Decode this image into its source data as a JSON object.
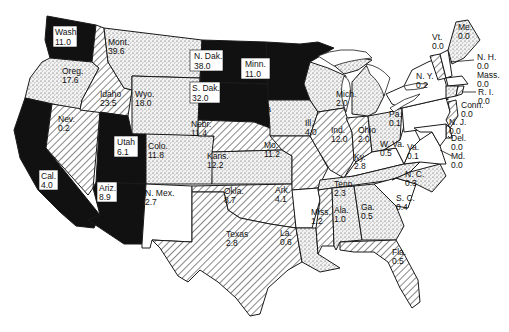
{
  "map": {
    "type": "choropleth",
    "region": "United States (48 contiguous states)",
    "fill_classes": {
      "black": "solid black",
      "dotted": "stippled",
      "hatched": "diagonal hatching",
      "white": "blank"
    },
    "colors": {
      "ink": "#1a1a1a",
      "paper": "#ffffff"
    }
  },
  "states": {
    "wash": {
      "name": "Wash.",
      "value": "11.0",
      "fill": "black"
    },
    "oreg": {
      "name": "Oreg.",
      "value": "17.6",
      "fill": "dotted"
    },
    "cal": {
      "name": "Cal.",
      "value": "4.0",
      "fill": "black"
    },
    "idaho": {
      "name": "Idaho",
      "value": "23.5",
      "fill": "hatched"
    },
    "nev": {
      "name": "Nev.",
      "value": "0.2",
      "fill": "hatched"
    },
    "mont": {
      "name": "Mont.",
      "value": "39.6",
      "fill": "dotted"
    },
    "wyo": {
      "name": "Wyo.",
      "value": "18.0",
      "fill": "dotted"
    },
    "utah": {
      "name": "Utah",
      "value": "6.1",
      "fill": "black"
    },
    "ariz": {
      "name": "Ariz.",
      "value": "8.9",
      "fill": "black"
    },
    "colo": {
      "name": "Colo.",
      "value": "11.8",
      "fill": "dotted"
    },
    "nmex": {
      "name": "N. Mex.",
      "value": "2.7",
      "fill": "white"
    },
    "ndak": {
      "name": "N. Dak.",
      "value": "38.0",
      "fill": "black"
    },
    "sdak": {
      "name": "S. Dak.",
      "value": "32.0",
      "fill": "black"
    },
    "nebr": {
      "name": "Nebr.",
      "value": "11.4",
      "fill": "hatched"
    },
    "kans": {
      "name": "Kans.",
      "value": "12.2",
      "fill": "dotted"
    },
    "okla": {
      "name": "Okla.",
      "value": "8.7",
      "fill": "hatched"
    },
    "texas": {
      "name": "Texas",
      "value": "2.8",
      "fill": "hatched"
    },
    "minn": {
      "name": "Minn.",
      "value": "11.0",
      "fill": "black"
    },
    "iowa": {
      "name": "Iowa",
      "value": "19.9",
      "fill": "dotted"
    },
    "mo": {
      "name": "Mo.",
      "value": "11.2",
      "fill": "hatched"
    },
    "ark": {
      "name": "Ark.",
      "value": "4.1",
      "fill": "white"
    },
    "la": {
      "name": "La.",
      "value": "0.6",
      "fill": "dotted"
    },
    "wis": {
      "name": "Wis.",
      "value": "4.5",
      "fill": "dotted"
    },
    "ill": {
      "name": "Ill.",
      "value": "4.0",
      "fill": "hatched"
    },
    "mich": {
      "name": "Mich.",
      "value": "2.0",
      "fill": "dotted"
    },
    "ind": {
      "name": "Ind.",
      "value": "12.0",
      "fill": "hatched"
    },
    "ohio": {
      "name": "Ohio",
      "value": "2.0",
      "fill": "dotted"
    },
    "ky": {
      "name": "Ky.",
      "value": "2.8",
      "fill": "white"
    },
    "tenn": {
      "name": "Tenn.",
      "value": "2.3",
      "fill": "dotted"
    },
    "miss": {
      "name": "Miss.",
      "value": "1.2",
      "fill": "hatched"
    },
    "ala": {
      "name": "Ala.",
      "value": "1.0",
      "fill": "dotted"
    },
    "ga": {
      "name": "Ga.",
      "value": "0.5",
      "fill": "dotted"
    },
    "fla": {
      "name": "Fla.",
      "value": "0.5",
      "fill": "hatched"
    },
    "sc": {
      "name": "S. C.",
      "value": "0.4",
      "fill": "white"
    },
    "nc": {
      "name": "N. C.",
      "value": "0.3",
      "fill": "dotted"
    },
    "va": {
      "name": "Va.",
      "value": "0.1",
      "fill": "white"
    },
    "wva": {
      "name": "W. Va.",
      "value": "0.5",
      "fill": "white"
    },
    "pa": {
      "name": "Pa.",
      "value": "0.1",
      "fill": "white"
    },
    "ny": {
      "name": "N. Y.",
      "value": "0.2",
      "fill": "white"
    },
    "vt": {
      "name": "Vt.",
      "value": "0.0",
      "fill": "hatched"
    },
    "nh": {
      "name": "N. H.",
      "value": "0.0",
      "fill": "white"
    },
    "me": {
      "name": "Me.",
      "value": "0.0",
      "fill": "dotted"
    },
    "mass": {
      "name": "Mass.",
      "value": "0.0",
      "fill": "white"
    },
    "ri": {
      "name": "R. I.",
      "value": "0.0",
      "fill": "hatched"
    },
    "conn": {
      "name": "Conn.",
      "value": "0.0",
      "fill": "dotted"
    },
    "nj": {
      "name": "N. J.",
      "value": "0.0",
      "fill": "hatched"
    },
    "del": {
      "name": "Del.",
      "value": "0.0",
      "fill": "hatched"
    },
    "md": {
      "name": "Md.",
      "value": "0.0",
      "fill": "white"
    }
  }
}
